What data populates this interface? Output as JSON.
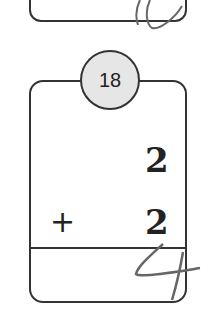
{
  "problem": {
    "number": "18",
    "addend_top": "2",
    "operator": "+",
    "addend_bottom": "2",
    "handwritten_answer": "4"
  }
}
